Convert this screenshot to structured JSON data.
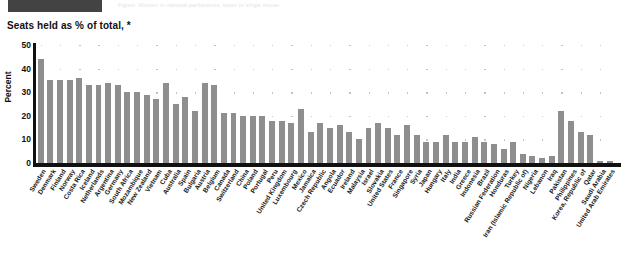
{
  "header": {
    "block_label": "",
    "faint_text": "Figure: Women in national parliaments, lower or single house"
  },
  "chart_data": {
    "type": "bar",
    "title": "Seats held as % of total, *",
    "xlabel": "",
    "ylabel": "Percent",
    "ylim": [
      0,
      50
    ],
    "yticks": [
      0,
      10,
      20,
      30,
      40,
      50
    ],
    "grid": "dotted",
    "legend": "none",
    "bar_color": "#8e8e8e",
    "categories": [
      "Sweden",
      "Denmark",
      "Finland",
      "Norway",
      "Costa Rica",
      "Iceland",
      "Netherlands",
      "Argentina",
      "Germany",
      "South Africa",
      "Mozambique",
      "New Zealand",
      "Vietnam",
      "Cuba",
      "Australia",
      "Spain",
      "Bulgaria",
      "Austria",
      "Belgium",
      "Canada",
      "Switzerland",
      "China",
      "Poland",
      "Portugal",
      "Peru",
      "United Kingdom",
      "Luxembourg",
      "Mexico",
      "Jamaica",
      "Czech Republic",
      "Angola",
      "Ecuador",
      "Ireland",
      "Malaysia",
      "Israel",
      "Slovakia",
      "United States",
      "France",
      "Singapore",
      "Syria",
      "Japan",
      "Hungary",
      "Italy",
      "India",
      "Greece",
      "Indonesia",
      "Brazil",
      "Russian Federation",
      "Honduras",
      "Turkey",
      "Iran (Islamic Republic of)",
      "Nigeria",
      "Lebanon",
      "Iraq",
      "Pakistan",
      "Philippines",
      "Korea, Republic of",
      "Qatar",
      "Saudi Arabia",
      "United Arab Emirates"
    ],
    "values": [
      44,
      35,
      35,
      35,
      36,
      33,
      33,
      34,
      33,
      30,
      30,
      29,
      27,
      34,
      25,
      28,
      22,
      34,
      33,
      21,
      21,
      20,
      20,
      20,
      18,
      18,
      17,
      23,
      13,
      17,
      15,
      16,
      13,
      10,
      15,
      17,
      15,
      12,
      16,
      12,
      9,
      9,
      12,
      9,
      9,
      11,
      9,
      8,
      6,
      9,
      4,
      3,
      2,
      3,
      22,
      18,
      13,
      12,
      1,
      1
    ]
  }
}
